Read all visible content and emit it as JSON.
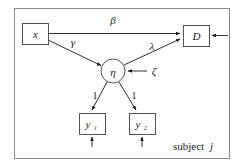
{
  "figure": {
    "type": "path-diagram",
    "frame": {
      "label": "subject j",
      "label_prefix": "subject",
      "label_index": "j"
    },
    "nodes": [
      {
        "id": "x",
        "label": "x",
        "sublabel": "",
        "shape": "rect",
        "role": "observed-covariate"
      },
      {
        "id": "D",
        "label": "D",
        "sublabel": "",
        "shape": "rect",
        "role": "observed-outcome"
      },
      {
        "id": "eta",
        "label": "η",
        "sublabel": "",
        "shape": "circle",
        "role": "latent-variable"
      },
      {
        "id": "y1",
        "label": "y",
        "sublabel": "1",
        "shape": "rect",
        "role": "observed-indicator"
      },
      {
        "id": "y2",
        "label": "y",
        "sublabel": "2",
        "shape": "rect",
        "role": "observed-indicator"
      }
    ],
    "edges": [
      {
        "id": "x-to-D",
        "from": "x",
        "to": "D",
        "label": "β"
      },
      {
        "id": "x-to-eta",
        "from": "x",
        "to": "eta",
        "label": "γ"
      },
      {
        "id": "eta-to-D",
        "from": "eta",
        "to": "D",
        "label": "λ"
      },
      {
        "id": "eta-to-y1",
        "from": "eta",
        "to": "y1",
        "label": "1"
      },
      {
        "id": "eta-to-y2",
        "from": "eta",
        "to": "y2",
        "label": "1"
      }
    ],
    "disturbances": [
      {
        "id": "zeta-to-eta",
        "target": "eta",
        "label": "ζ",
        "direction": "from-right"
      },
      {
        "id": "error-to-D",
        "target": "D",
        "label": "",
        "direction": "from-right"
      },
      {
        "id": "error-to-y1",
        "target": "y1",
        "label": "",
        "direction": "from-below"
      },
      {
        "id": "error-to-y2",
        "target": "y2",
        "label": "",
        "direction": "from-below"
      }
    ],
    "colors": {
      "stroke": "#1a1a1a",
      "frame": "#8a8a8a",
      "node_fill": "#ffffff",
      "background": "#ffffff",
      "text": "#1a1a1a"
    }
  }
}
